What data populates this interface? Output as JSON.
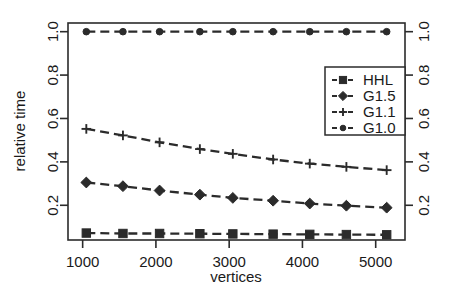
{
  "chart_data": {
    "type": "line",
    "title": "",
    "xlabel": "vertices",
    "ylabel": "relative time",
    "xlim": [
      800,
      5400
    ],
    "ylim": [
      0.04,
      1.04
    ],
    "grid": false,
    "legend_position": "right-upper-inside",
    "x": [
      1050,
      1550,
      2050,
      2600,
      3050,
      3600,
      4100,
      4600,
      5150
    ],
    "xticks": [
      1000,
      2000,
      3000,
      4000,
      5000
    ],
    "xticklabels": [
      "1000",
      "2000",
      "3000",
      "4000",
      "5000"
    ],
    "yticks": [
      0.2,
      0.4,
      0.6,
      0.8,
      1.0
    ],
    "yticklabels": [
      "0.2",
      "0.4",
      "0.6",
      "0.8",
      "1.0"
    ],
    "right_axis": true,
    "right_yticklabels": [
      "0.2",
      "0.4",
      "0.6",
      "0.8",
      "1.0"
    ],
    "series": [
      {
        "name": "HHL",
        "marker": "square",
        "values": [
          0.072,
          0.07,
          0.07,
          0.069,
          0.068,
          0.067,
          0.066,
          0.065,
          0.064
        ]
      },
      {
        "name": "G1.5",
        "marker": "diamond",
        "values": [
          0.305,
          0.288,
          0.268,
          0.249,
          0.234,
          0.221,
          0.208,
          0.198,
          0.189
        ]
      },
      {
        "name": "G1.1",
        "marker": "plus",
        "values": [
          0.552,
          0.522,
          0.49,
          0.459,
          0.437,
          0.411,
          0.392,
          0.377,
          0.362
        ]
      },
      {
        "name": "G1.0",
        "marker": "circle",
        "values": [
          1.0,
          1.0,
          1.0,
          1.0,
          1.0,
          1.0,
          1.0,
          1.0,
          1.0
        ]
      }
    ]
  },
  "legend": {
    "items": [
      {
        "label": "HHL",
        "marker": "square"
      },
      {
        "label": "G1.5",
        "marker": "diamond"
      },
      {
        "label": "G1.1",
        "marker": "plus"
      },
      {
        "label": "G1.0",
        "marker": "circle"
      }
    ]
  },
  "colors": {
    "ink": "#2b2b2b",
    "background": "#ffffff"
  }
}
